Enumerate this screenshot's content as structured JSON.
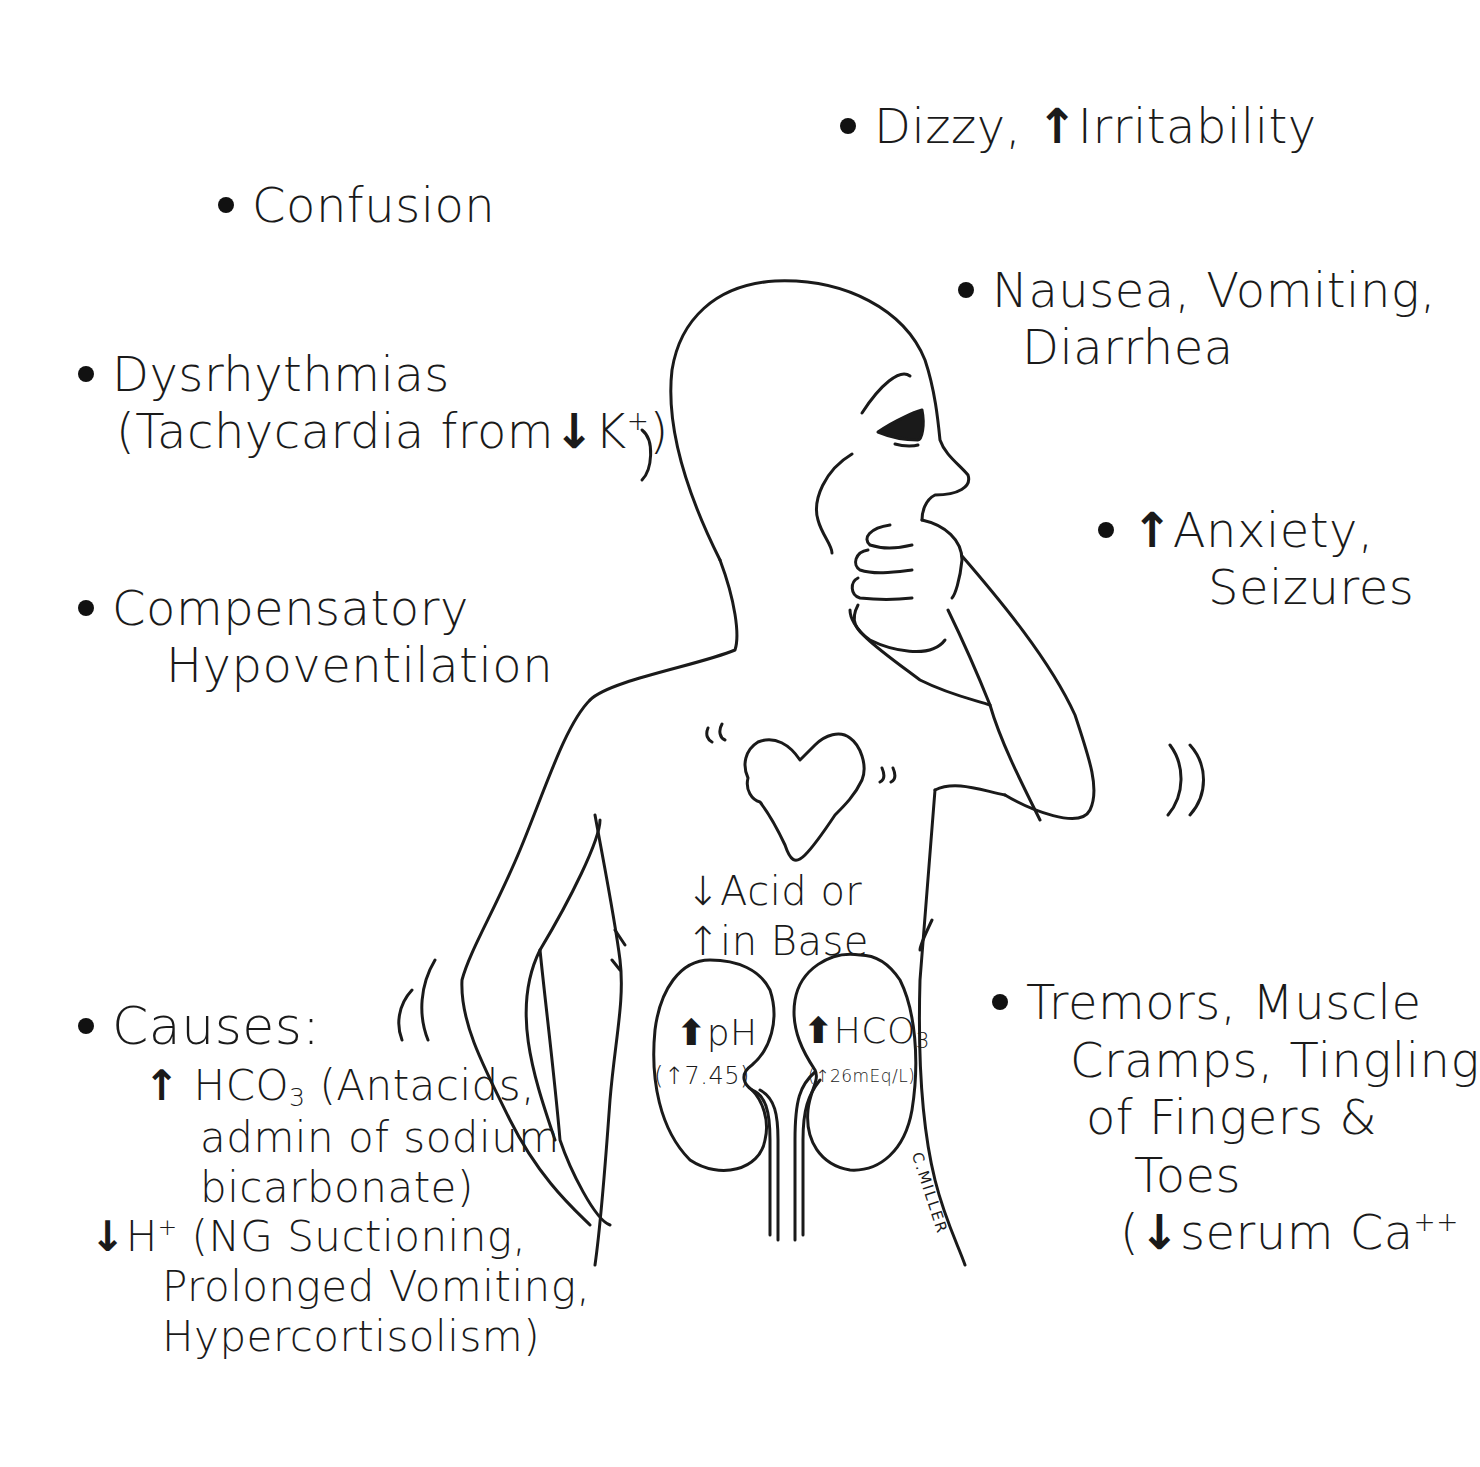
{
  "symptoms": {
    "dizzy": {
      "prefix": "Dizzy, ",
      "arrow": "↑",
      "text": "Irritability"
    },
    "confusion": {
      "text": "Confusion"
    },
    "nausea": {
      "line1": "Nausea, Vomiting,",
      "line2": "Diarrhea"
    },
    "dysrhythmias": {
      "line1": "Dysrhythmias",
      "line2_prefix": "(Tachycardia from",
      "arrow": "↓",
      "line2_ion": "K",
      "line2_sup": "+",
      "line2_suffix": ")"
    },
    "anxiety": {
      "arrow": "↑",
      "line1": "Anxiety,",
      "line2": "Seizures"
    },
    "compensatory": {
      "line1": "Compensatory",
      "line2": "Hypoventilation"
    },
    "tremors": {
      "line1": "Tremors, Muscle",
      "line2": "Cramps, Tingling",
      "line3": "of Fingers &",
      "line4": "Toes",
      "line5_open": "(",
      "line5_arrow": "↓",
      "line5_text": "serum Ca",
      "line5_sup": "++"
    }
  },
  "causes": {
    "title": "Causes:",
    "item1": {
      "arrow": "↑",
      "chem": "HCO",
      "sub": "3",
      "line1_rest": " (Antacids,",
      "line2": "admin of sodium",
      "line3": "bicarbonate)"
    },
    "item2": {
      "arrow": "↓",
      "ion": "H",
      "sup": "+",
      "line1_rest": " (NG Suctioning,",
      "line2": "Prolonged Vomiting,",
      "line3": "Hypercortisolism)"
    }
  },
  "body_labels": {
    "acid_line": {
      "arrow": "↓",
      "text": "Acid or"
    },
    "base_line": {
      "arrow": "↑",
      "text": "in Base"
    },
    "left_kidney": {
      "arrow": "⬆",
      "label": "pH",
      "value_open": "(",
      "value_arrow": "↑",
      "value": "7.45)"
    },
    "right_kidney": {
      "arrow": "⬆",
      "label": "HCO",
      "sub": "3",
      "value_open": "(",
      "value_arrow": "↑",
      "value": "26mEq/L)"
    }
  },
  "signature": "C.MILLER",
  "colors": {
    "ink": "#1a1a1a",
    "background": "#ffffff"
  }
}
